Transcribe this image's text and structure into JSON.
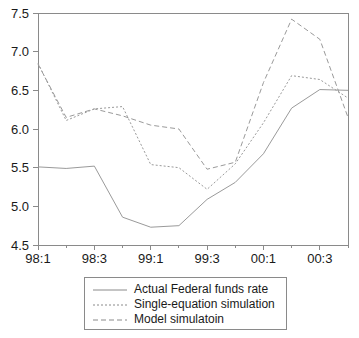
{
  "chart_data": {
    "type": "line",
    "title": "",
    "subtitle": "",
    "xlabel": "",
    "ylabel": "",
    "ylim": [
      4.5,
      7.5
    ],
    "ytick_values": [
      4.5,
      5.0,
      5.5,
      6.0,
      6.5,
      7.0,
      7.5
    ],
    "ytick_labels": [
      "4.5",
      "5.0",
      "5.5",
      "6.0",
      "6.5",
      "7.0",
      "7.5"
    ],
    "grid": false,
    "legend_position": "bottom",
    "x": [
      "98:1",
      "98:2",
      "98:3",
      "98:4",
      "99:1",
      "99:2",
      "99:3",
      "99:4",
      "00:1",
      "00:2",
      "00:3",
      "00:4"
    ],
    "xtick_labels": [
      "98:1",
      "98:3",
      "99:1",
      "99:3",
      "00:1",
      "00:3"
    ],
    "xtick_indices": [
      0,
      2,
      4,
      6,
      8,
      10
    ],
    "categories": [
      "98:1",
      "98:2",
      "98:3",
      "98:4",
      "99:1",
      "99:2",
      "99:3",
      "99:4",
      "00:1",
      "00:2",
      "00:3",
      "00:4"
    ],
    "series": [
      {
        "name": "Actual Federal funds rate",
        "style": "solid",
        "color": "#9a9a9a",
        "values": [
          5.51,
          5.49,
          5.52,
          4.86,
          4.73,
          4.75,
          5.09,
          5.31,
          5.68,
          6.27,
          6.51,
          6.5
        ]
      },
      {
        "name": "Single-equation simulation",
        "style": "dotted",
        "color": "#9a9a9a",
        "values": [
          6.85,
          6.11,
          6.26,
          6.29,
          5.54,
          5.5,
          5.22,
          5.55,
          6.08,
          6.69,
          6.64,
          6.4
        ]
      },
      {
        "name": "Model simulatoin",
        "style": "dashed",
        "color": "#9a9a9a",
        "values": [
          6.84,
          6.15,
          6.26,
          6.17,
          6.05,
          6.0,
          5.48,
          5.57,
          6.6,
          7.42,
          7.16,
          6.15
        ]
      }
    ]
  },
  "legend": {
    "items": [
      {
        "label": "Actual Federal funds rate",
        "style": "solid"
      },
      {
        "label": "Single-equation simulation",
        "style": "dotted"
      },
      {
        "label": "Model simulatoin",
        "style": "dashed"
      }
    ]
  },
  "colors": {
    "background": "#ffffff",
    "axis": "#8a8a8a",
    "line": "#9a9a9a",
    "text": "#1a1a1a"
  }
}
